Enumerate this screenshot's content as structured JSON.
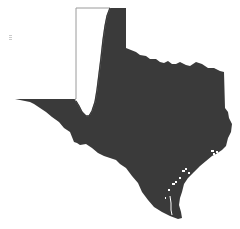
{
  "map": {
    "region": "Texas",
    "fill_color": "#3a3a3a",
    "unfilled_color": "#ffffff",
    "outline_color": "#9a9a9a",
    "background_color": "#ffffff"
  }
}
